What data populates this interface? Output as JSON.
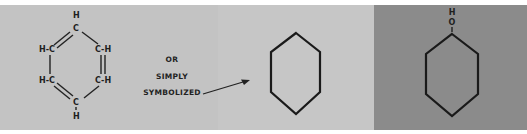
{
  "diagram": {
    "colors": {
      "panel_1_bg": "#c3c3c3",
      "panel_2_bg": "#c6c6c6",
      "panel_3_bg": "#8b8b8b",
      "ink": "#1e1e1e"
    },
    "structural_formula": {
      "top": {
        "h": "H",
        "c": "C"
      },
      "upper_left": "H-C",
      "upper_right": "C-H",
      "lower_left": "H-C",
      "lower_right": "C-H",
      "bottom": {
        "c": "C",
        "h": "H"
      }
    },
    "captions": {
      "line1": "OR",
      "line2": "SIMPLY",
      "line3": "SYMBOLIZED"
    },
    "substituted_ring": {
      "h": "H",
      "o": "O"
    }
  }
}
